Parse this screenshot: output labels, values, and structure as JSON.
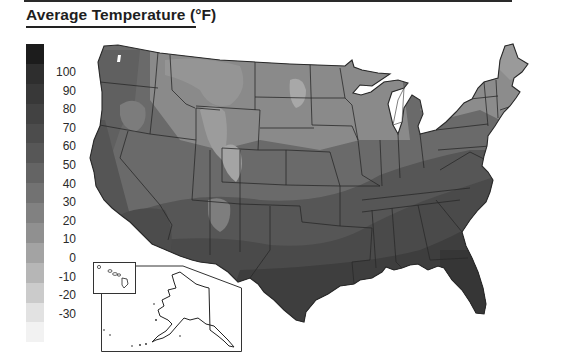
{
  "title": "Average Temperature (°F)",
  "map": {
    "region": "United States (contiguous) with Alaska and Hawaii insets",
    "variable": "Average Temperature",
    "units": "°F",
    "palette": "grayscale, darker = warmer"
  },
  "legend": {
    "labels": [
      "100",
      "90",
      "80",
      "70",
      "60",
      "50",
      "40",
      "30",
      "20",
      "10",
      "0",
      "-10",
      "-20",
      "-30"
    ],
    "swatch_colors": [
      "#1c1c1c",
      "#2e2e2e",
      "#383838",
      "#424242",
      "#4c4c4c",
      "#575757",
      "#646464",
      "#727272",
      "#818181",
      "#909090",
      "#a3a3a3",
      "#b6b6b6",
      "#cbcbcb",
      "#e2e2e2",
      "#f2f2f2"
    ]
  },
  "insets": {
    "hawaii": "Hawaii inset",
    "alaska": "Alaska inset"
  }
}
